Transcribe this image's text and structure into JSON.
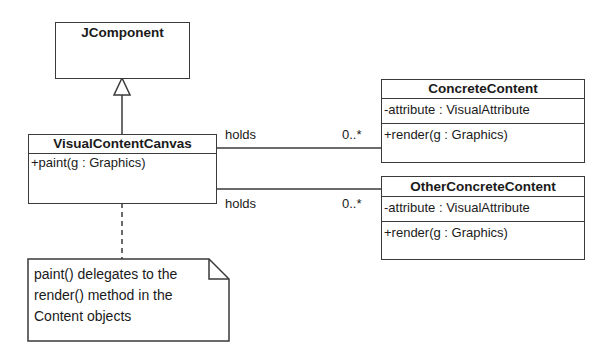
{
  "diagram": {
    "type": "uml-class-diagram",
    "classes": {
      "jcomponent": {
        "name": "JComponent"
      },
      "visual_content_canvas": {
        "name": "VisualContentCanvas",
        "operations": [
          "+paint(g : Graphics)"
        ]
      },
      "concrete_content": {
        "name": "ConcreteContent",
        "attributes": [
          "-attribute : VisualAttribute"
        ],
        "operations": [
          "+render(g : Graphics)"
        ]
      },
      "other_concrete_content": {
        "name": "OtherConcreteContent",
        "attributes": [
          "-attribute : VisualAttribute"
        ],
        "operations": [
          "+render(g : Graphics)"
        ]
      }
    },
    "relationships": {
      "generalization": {
        "from": "VisualContentCanvas",
        "to": "JComponent"
      },
      "assoc1": {
        "from": "VisualContentCanvas",
        "to": "ConcreteContent",
        "label": "holds",
        "multiplicity": "0..*"
      },
      "assoc2": {
        "from": "VisualContentCanvas",
        "to": "OtherConcreteContent",
        "label": "holds",
        "multiplicity": "0..*"
      }
    },
    "note": {
      "lines": [
        "paint() delegates to the",
        "render() method in the",
        "Content objects"
      ]
    },
    "colors": {
      "line": "#3a3a3a",
      "background": "#ffffff",
      "text": "#1a1a1a"
    }
  }
}
